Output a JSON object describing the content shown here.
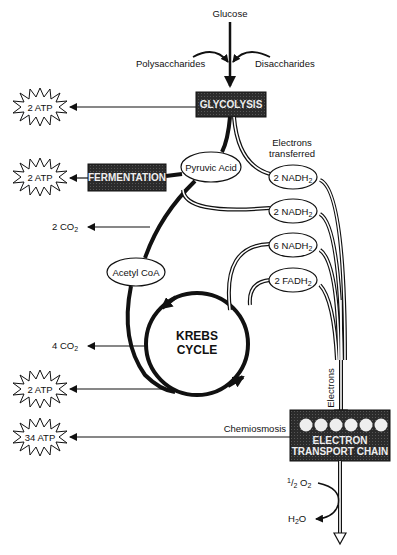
{
  "diagram": {
    "type": "cellular-respiration-flow",
    "inputs": {
      "top": "Glucose",
      "left": "Polysaccharides",
      "right": "Disaccharides"
    },
    "processes": {
      "glycolysis": "GLYCOLYSIS",
      "fermentation": "FERMENTATION",
      "krebs_line1": "KREBS",
      "krebs_line2": "CYCLE",
      "etc_line1": "ELECTRON",
      "etc_line2": "TRANSPORT CHAIN"
    },
    "intermediates": {
      "pyruvic_acid": "Pyruvic Acid",
      "acetyl_coa": "Acetyl CoA"
    },
    "carriers": [
      {
        "count": "2",
        "name": "NADH",
        "sub": "2"
      },
      {
        "count": "2",
        "name": "NADH",
        "sub": "2"
      },
      {
        "count": "6",
        "name": "NADH",
        "sub": "2"
      },
      {
        "count": "2",
        "name": "FADH",
        "sub": "2"
      }
    ],
    "atp_outputs": [
      {
        "label": "2 ATP",
        "source": "Glycolysis"
      },
      {
        "label": "2 ATP",
        "source": "Fermentation"
      },
      {
        "label": "2 ATP",
        "source": "Krebs Cycle"
      },
      {
        "label": "34 ATP",
        "source": "Electron Transport Chain"
      }
    ],
    "co2_outputs": [
      {
        "count": "2",
        "name": "CO",
        "sub": "2"
      },
      {
        "count": "4",
        "name": "CO",
        "sub": "2"
      }
    ],
    "annotations": {
      "electrons_transferred_1": "Electrons",
      "electrons_transferred_2": "transferred",
      "electrons": "Electrons",
      "chemiosmosis": "Chemiosmosis",
      "oxygen_num": "1",
      "oxygen_den": "2",
      "oxygen_name": "O",
      "oxygen_sub": "2",
      "water_h": "H",
      "water_sub": "2",
      "water_o": "O"
    },
    "colors": {
      "box_fill": "#2a2a2a",
      "line": "#111111",
      "background": "#ffffff"
    }
  }
}
